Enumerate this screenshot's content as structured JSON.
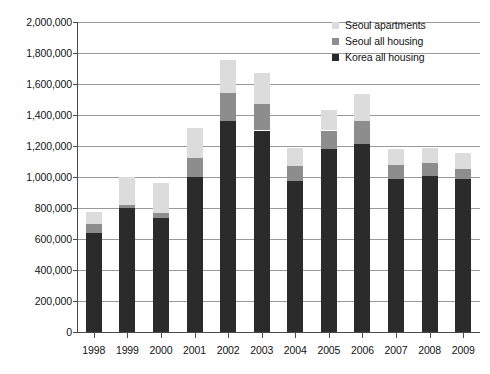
{
  "chart_data": {
    "type": "bar",
    "subtype": "stacked-vertical",
    "title": "",
    "subtitle": "",
    "xlabel": "",
    "ylabel": "",
    "ylim": [
      0,
      2000000
    ],
    "ytick_step": 200000,
    "grid": true,
    "legend_position": "top-right",
    "categories": [
      "1998",
      "1999",
      "2000",
      "2001",
      "2002",
      "2003",
      "2004",
      "2005",
      "2006",
      "2007",
      "2008",
      "2009"
    ],
    "ytick_labels": [
      "2,000,000",
      "1,800,000",
      "1,600,000",
      "1,400,000",
      "1,200,000",
      "1,000,000",
      "800,000",
      "600,000",
      "400,000",
      "200,000",
      "0"
    ],
    "ytick_values": [
      2000000,
      1800000,
      1600000,
      1400000,
      1200000,
      1000000,
      800000,
      600000,
      400000,
      200000,
      0
    ],
    "series": [
      {
        "name": "Korea all housing",
        "color": "#2b2b2b",
        "stack_order": 0,
        "values": [
          640000,
          800000,
          735000,
          1000000,
          1360000,
          1300000,
          975000,
          1180000,
          1215000,
          985000,
          1005000,
          985000
        ]
      },
      {
        "name": "Seoul all housing",
        "color": "#8d8d8d",
        "stack_order": 1,
        "values": [
          55000,
          20000,
          35000,
          120000,
          180000,
          170000,
          95000,
          120000,
          145000,
          90000,
          85000,
          65000
        ]
      },
      {
        "name": "Seoul apartments",
        "color": "#dcdcdc",
        "stack_order": 2,
        "values": [
          80000,
          180000,
          190000,
          195000,
          215000,
          200000,
          120000,
          135000,
          175000,
          105000,
          95000,
          105000
        ]
      }
    ],
    "cumulative_tops": {
      "korea_all_housing": [
        640000,
        800000,
        735000,
        1000000,
        1360000,
        1300000,
        975000,
        1180000,
        1215000,
        985000,
        1005000,
        985000
      ],
      "seoul_all_housing": [
        695000,
        820000,
        770000,
        1120000,
        1540000,
        1470000,
        1070000,
        1300000,
        1360000,
        1075000,
        1090000,
        1050000
      ],
      "seoul_apartments": [
        775000,
        1000000,
        960000,
        1315000,
        1755000,
        1670000,
        1190000,
        1435000,
        1535000,
        1180000,
        1185000,
        1155000
      ]
    }
  },
  "legend": {
    "items": [
      {
        "label": "Seoul apartments",
        "color": "#dcdcdc"
      },
      {
        "label": "Seoul all housing",
        "color": "#8d8d8d"
      },
      {
        "label": "Korea all housing",
        "color": "#2b2b2b"
      }
    ]
  },
  "axes": {
    "gridline_color": "#9a9a9a",
    "axis_color": "#4a4a4a"
  }
}
